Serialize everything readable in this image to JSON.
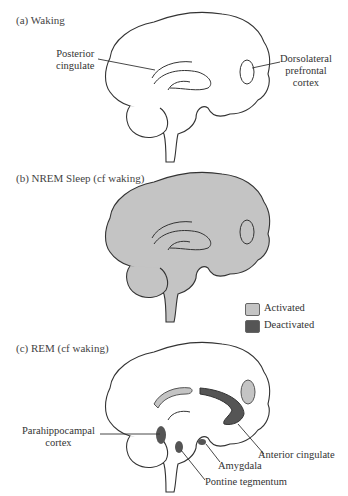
{
  "panels": [
    {
      "id": "a",
      "title": "(a) Waking",
      "labels": {
        "posterior_cingulate": [
          "Posterior",
          "cingulate"
        ],
        "dlpfc": [
          "Dorsolateral",
          "prefrontal",
          "cortex"
        ]
      }
    },
    {
      "id": "b",
      "title": "(b) NREM Sleep (cf waking)"
    },
    {
      "id": "c",
      "title": "(c) REM (cf waking)",
      "labels": {
        "parahippocampal": [
          "Parahippocampal",
          "cortex"
        ],
        "anterior_cingulate": "Anterior cingulate",
        "amygdala": "Amygdala",
        "pontine": "Pontine tegmentum"
      }
    }
  ],
  "legend": {
    "activated": {
      "label": "Activated",
      "color": "#c4c4c4"
    },
    "deactivated": {
      "label": "Deactivated",
      "color": "#555555"
    }
  },
  "colors": {
    "outline": "#333333",
    "activated": "#c4c4c4",
    "deactivated": "#555555"
  }
}
